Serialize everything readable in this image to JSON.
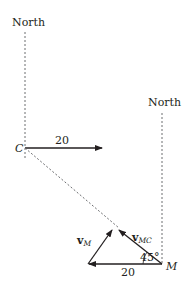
{
  "diagram": {
    "type": "vector-diagram",
    "north_left": {
      "label": "North"
    },
    "north_right": {
      "label": "North"
    },
    "point_c": {
      "label": "C"
    },
    "point_m": {
      "label": "M"
    },
    "velocity_c": {
      "label": "20"
    },
    "triangle": {
      "base_label": "20",
      "angle_label": "45°",
      "vec_m": {
        "main": "v",
        "sub": "M"
      },
      "vec_mc": {
        "main": "v",
        "sub": "MC"
      }
    },
    "colors": {
      "line": "#231f20",
      "dashed": "#6d6e71"
    }
  }
}
